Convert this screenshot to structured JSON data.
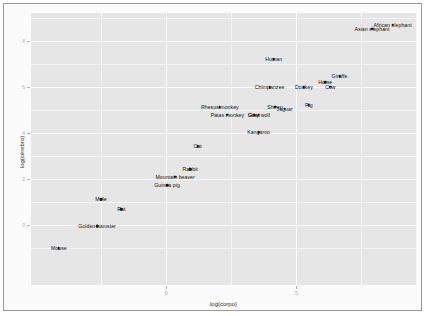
{
  "chart_data": {
    "type": "scatter",
    "title": "",
    "xlabel": "log(corpo)",
    "ylabel": "log(cérebro)",
    "xlim": [
      -5.2,
      9.6
    ],
    "ylim": [
      -2.6,
      9.2
    ],
    "xticks": [
      "0",
      "5"
    ],
    "xtick_values": [
      0,
      5
    ],
    "yticks": [
      "0",
      "2",
      "4",
      "6",
      "8"
    ],
    "ytick_values": [
      0,
      2,
      4,
      6,
      8
    ],
    "grid": true,
    "legend": "none",
    "point_color": "#1a1a1a",
    "panel_color": "#e6e6e6",
    "gridline_color": "#ffffff",
    "points": [
      {
        "label": "African elephant",
        "x": 8.7,
        "y": 8.7
      },
      {
        "label": "Asian elephant",
        "x": 7.91,
        "y": 8.52
      },
      {
        "label": "Human",
        "x": 4.13,
        "y": 7.19
      },
      {
        "label": "Giraffe",
        "x": 6.66,
        "y": 6.45
      },
      {
        "label": "Horse",
        "x": 6.11,
        "y": 6.19
      },
      {
        "label": "Donkey",
        "x": 5.29,
        "y": 5.99
      },
      {
        "label": "Chimpanzee",
        "x": 3.97,
        "y": 5.99
      },
      {
        "label": "Cow",
        "x": 6.31,
        "y": 6.0
      },
      {
        "label": "Pig",
        "x": 5.48,
        "y": 5.19
      },
      {
        "label": "Jaguar",
        "x": 4.55,
        "y": 5.05
      },
      {
        "label": "Sheep",
        "x": 4.18,
        "y": 5.14
      },
      {
        "label": "Grey wolf",
        "x": 3.56,
        "y": 4.79
      },
      {
        "label": "Goat",
        "x": 3.37,
        "y": 4.78
      },
      {
        "label": "Rhesus monkey",
        "x": 2.06,
        "y": 5.11
      },
      {
        "label": "Patas monkey",
        "x": 2.35,
        "y": 4.79
      },
      {
        "label": "Kangaroo",
        "x": 3.55,
        "y": 4.02
      },
      {
        "label": "Cat",
        "x": 1.21,
        "y": 3.41
      },
      {
        "label": "Rabbit",
        "x": 0.92,
        "y": 2.42
      },
      {
        "label": "Mountain beaver",
        "x": 0.34,
        "y": 2.1
      },
      {
        "label": "Guinea pig",
        "x": 0.03,
        "y": 1.73
      },
      {
        "label": "Mole",
        "x": -2.51,
        "y": 1.13
      },
      {
        "label": "Rat",
        "x": -1.73,
        "y": 0.69
      },
      {
        "label": "Golden hamster",
        "x": -2.66,
        "y": -0.04
      },
      {
        "label": "Mouse",
        "x": -4.13,
        "y": -1.0
      }
    ]
  }
}
